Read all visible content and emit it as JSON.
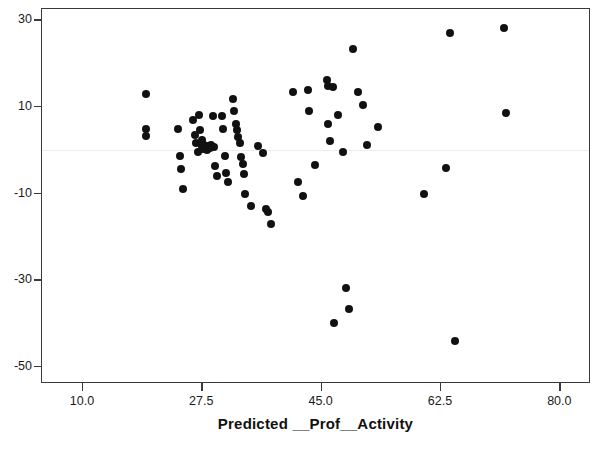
{
  "chart_data": {
    "type": "scatter",
    "title": "",
    "xlabel": "Predicted __Prof__Activity",
    "ylabel": "",
    "xlim": [
      4.0,
      84.2
    ],
    "ylim": [
      -53.5,
      32.6
    ],
    "xticks": [
      10.0,
      27.5,
      45.0,
      62.5,
      80.0
    ],
    "xtick_labels": [
      "10.0",
      "27.5",
      "45.0",
      "62.5",
      "80.0"
    ],
    "yticks": [
      30,
      10,
      -10,
      -30,
      -50
    ],
    "ytick_labels": [
      "30",
      "10",
      "-10",
      "-30",
      "-50"
    ],
    "grid": false,
    "legend": null,
    "reference_line": {
      "orientation": "horizontal",
      "y": 0,
      "color": "#ededed"
    },
    "marker": {
      "shape": "circle",
      "color": "#111111",
      "size": 8
    },
    "points": [
      {
        "x": 19.2,
        "y": 13.0
      },
      {
        "x": 19.2,
        "y": 4.8
      },
      {
        "x": 19.2,
        "y": 3.2
      },
      {
        "x": 24.0,
        "y": 4.9
      },
      {
        "x": 24.2,
        "y": -1.3
      },
      {
        "x": 24.4,
        "y": -4.3
      },
      {
        "x": 24.6,
        "y": -8.9
      },
      {
        "x": 26.2,
        "y": 7.0
      },
      {
        "x": 26.4,
        "y": 3.5
      },
      {
        "x": 26.6,
        "y": 1.7
      },
      {
        "x": 26.8,
        "y": -0.4
      },
      {
        "x": 27.0,
        "y": 8.2
      },
      {
        "x": 27.2,
        "y": 4.6
      },
      {
        "x": 27.4,
        "y": 2.3
      },
      {
        "x": 27.5,
        "y": 1.0
      },
      {
        "x": 27.6,
        "y": 0.2
      },
      {
        "x": 27.8,
        "y": 1.2
      },
      {
        "x": 28.0,
        "y": 0.6
      },
      {
        "x": 28.2,
        "y": 0.1
      },
      {
        "x": 28.4,
        "y": 1.0
      },
      {
        "x": 28.6,
        "y": 0.4
      },
      {
        "x": 28.8,
        "y": 1.3
      },
      {
        "x": 29.0,
        "y": 7.8
      },
      {
        "x": 29.2,
        "y": 0.7
      },
      {
        "x": 29.4,
        "y": -3.6
      },
      {
        "x": 29.6,
        "y": -6.0
      },
      {
        "x": 30.4,
        "y": 8.0
      },
      {
        "x": 30.6,
        "y": 5.0
      },
      {
        "x": 30.8,
        "y": -1.4
      },
      {
        "x": 31.0,
        "y": -5.2
      },
      {
        "x": 31.2,
        "y": -7.4
      },
      {
        "x": 32.0,
        "y": 11.8
      },
      {
        "x": 32.2,
        "y": 9.0
      },
      {
        "x": 32.4,
        "y": 6.0
      },
      {
        "x": 32.6,
        "y": 4.6
      },
      {
        "x": 32.8,
        "y": 3.0
      },
      {
        "x": 33.0,
        "y": 1.6
      },
      {
        "x": 33.2,
        "y": -1.6
      },
      {
        "x": 33.4,
        "y": -3.2
      },
      {
        "x": 33.6,
        "y": -5.6
      },
      {
        "x": 33.8,
        "y": -10.2
      },
      {
        "x": 34.6,
        "y": -12.9
      },
      {
        "x": 35.6,
        "y": 1.0
      },
      {
        "x": 36.4,
        "y": -0.6
      },
      {
        "x": 36.8,
        "y": -13.6
      },
      {
        "x": 37.2,
        "y": -14.2
      },
      {
        "x": 37.6,
        "y": -17.0
      },
      {
        "x": 40.8,
        "y": 13.4
      },
      {
        "x": 41.6,
        "y": -7.4
      },
      {
        "x": 42.2,
        "y": -10.6
      },
      {
        "x": 43.0,
        "y": 14.0
      },
      {
        "x": 43.2,
        "y": 9.0
      },
      {
        "x": 44.0,
        "y": -3.4
      },
      {
        "x": 45.8,
        "y": 16.2
      },
      {
        "x": 45.9,
        "y": 14.8
      },
      {
        "x": 46.0,
        "y": 6.0
      },
      {
        "x": 46.2,
        "y": 2.2
      },
      {
        "x": 46.6,
        "y": 14.6
      },
      {
        "x": 46.8,
        "y": -39.8
      },
      {
        "x": 47.4,
        "y": 8.2
      },
      {
        "x": 48.2,
        "y": -0.4
      },
      {
        "x": 48.6,
        "y": -31.8
      },
      {
        "x": 49.0,
        "y": -36.6
      },
      {
        "x": 49.6,
        "y": 23.4
      },
      {
        "x": 50.4,
        "y": 13.4
      },
      {
        "x": 51.0,
        "y": 10.4
      },
      {
        "x": 51.6,
        "y": 1.2
      },
      {
        "x": 53.2,
        "y": 5.4
      },
      {
        "x": 60.0,
        "y": -10.2
      },
      {
        "x": 63.2,
        "y": -4.0
      },
      {
        "x": 63.8,
        "y": 27.0
      },
      {
        "x": 64.6,
        "y": -44.0
      },
      {
        "x": 71.8,
        "y": 28.2
      },
      {
        "x": 72.0,
        "y": 8.6
      }
    ]
  },
  "axis": {
    "title_fragment": ""
  }
}
